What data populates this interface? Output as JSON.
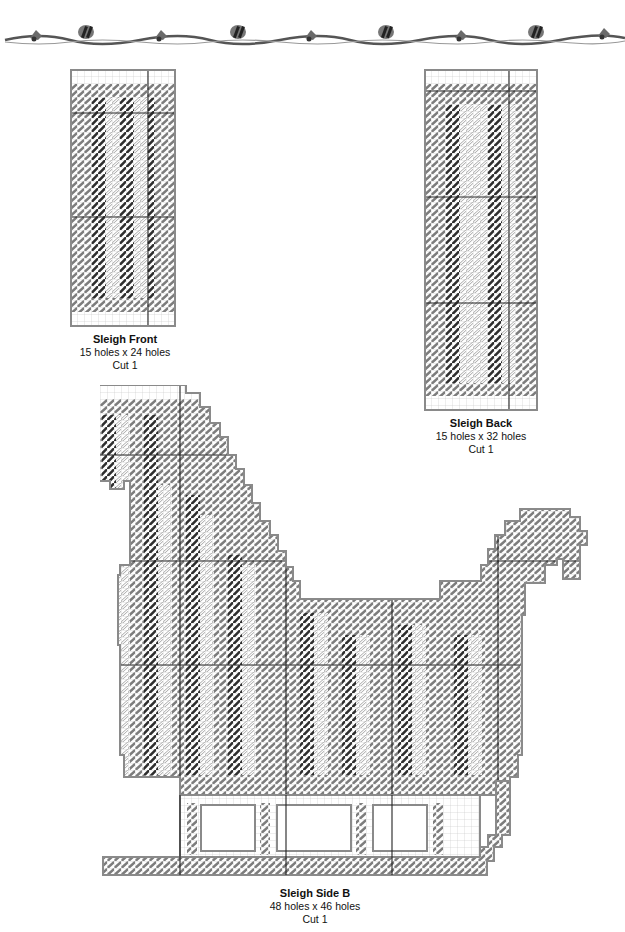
{
  "decoration": {
    "name": "holly-vine-border",
    "motifs": 10
  },
  "colors": {
    "grid_line": "#bdbdbd",
    "outline": "#8a8a8a",
    "center_line": "#222222",
    "stitch_medium": "#808080",
    "stitch_dark": "#303030",
    "stitch_light_outline": "#9a9a9a",
    "paper": "#ffffff"
  },
  "pieces": [
    {
      "id": "sleigh-front",
      "title": "Sleigh Front",
      "size": "15 holes x 24 holes",
      "cut": "Cut 1"
    },
    {
      "id": "sleigh-back",
      "title": "Sleigh Back",
      "size": "15 holes x 32 holes",
      "cut": "Cut 1"
    },
    {
      "id": "sleigh-side-b",
      "title": "Sleigh Side B",
      "size": "48 holes x 46 holes",
      "cut": "Cut 1"
    }
  ]
}
